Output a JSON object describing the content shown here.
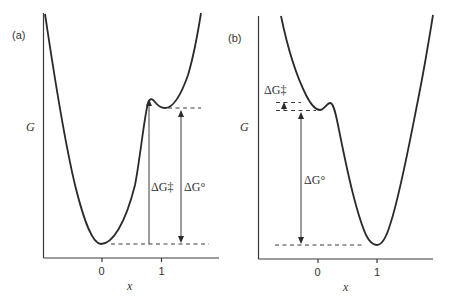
{
  "panels": [
    {
      "label": "(a)",
      "y_axis_label": "G",
      "x_axis_label": "x",
      "x_ticks": [
        "0",
        "1"
      ],
      "annotations": {
        "activation": "ΔG‡",
        "standard": "ΔG°"
      },
      "description": "Reactant well at x=0 is deep; product at x≈1 is a shallow well just beyond a small barrier; ΔG‡ ≈ ΔG° (late, product-like transition state)"
    },
    {
      "label": "(b)",
      "y_axis_label": "G",
      "x_axis_label": "x",
      "x_ticks": [
        "0",
        "1"
      ],
      "annotations": {
        "activation": "ΔG‡",
        "standard": "ΔG°"
      },
      "description": "Reactant is a shallow well near x≈0 with a small barrier; product well at x=1 is deep; small ΔG‡ and large negative ΔG° (early, reactant-like transition state)"
    }
  ],
  "colors": {
    "line": "#2a2a2a",
    "background": "#ffffff"
  }
}
